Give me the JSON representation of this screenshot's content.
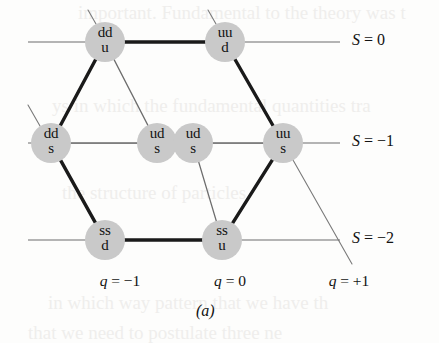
{
  "figure": {
    "caption": "(a)",
    "background_color": "#fdfdfc",
    "node_fill_color": "#c9c9c9",
    "thick_edge_color": "#1a1a1a",
    "thin_edge_color": "#6d6d6d"
  },
  "chart_data": {
    "type": "scatter",
    "xlabel": "q",
    "ylabel": "S",
    "grid": false,
    "legend": null,
    "x_tick_labels": [
      "q = -1",
      "q = 0",
      "q = +1"
    ],
    "x_tick_values": [
      -1,
      0,
      1
    ],
    "y_tick_labels": [
      "S = 0",
      "S = -1",
      "S = -2"
    ],
    "y_tick_values": [
      0,
      -1,
      -2
    ],
    "nodes": [
      {
        "id": "n1",
        "top": "dd",
        "bottom": "u",
        "q": -1,
        "S": 0,
        "cx": 105,
        "cy": 42
      },
      {
        "id": "n2",
        "top": "uu",
        "bottom": "d",
        "q": 0,
        "S": 0,
        "cx": 225,
        "cy": 42
      },
      {
        "id": "n3",
        "top": "dd",
        "bottom": "s",
        "q": -1,
        "S": -1,
        "cx": 51,
        "cy": 143
      },
      {
        "id": "n4",
        "top": "ud",
        "bottom": "s",
        "q": 0,
        "S": -1,
        "cx": 157,
        "cy": 143
      },
      {
        "id": "n5",
        "top": "ud",
        "bottom": "s",
        "q": 0,
        "S": -1,
        "cx": 193,
        "cy": 143
      },
      {
        "id": "n6",
        "top": "uu",
        "bottom": "s",
        "q": 1,
        "S": -1,
        "cx": 283,
        "cy": 143
      },
      {
        "id": "n7",
        "top": "ss",
        "bottom": "d",
        "q": -1,
        "S": -2,
        "cx": 105,
        "cy": 240
      },
      {
        "id": "n8",
        "top": "ss",
        "bottom": "u",
        "q": 0,
        "S": -2,
        "cx": 222,
        "cy": 240
      }
    ],
    "edges": [
      {
        "from": "n1",
        "to": "n2",
        "weight": "thick"
      },
      {
        "from": "n1",
        "to": "n3",
        "weight": "thick"
      },
      {
        "from": "n1",
        "to": "n4",
        "weight": "thin"
      },
      {
        "from": "n2",
        "to": "n6",
        "weight": "thick"
      },
      {
        "from": "n3",
        "to": "n4",
        "weight": "thin"
      },
      {
        "from": "n3",
        "to": "n7",
        "weight": "thick"
      },
      {
        "from": "n5",
        "to": "n6",
        "weight": "thin"
      },
      {
        "from": "n5",
        "to": "n8",
        "weight": "thin"
      },
      {
        "from": "n6",
        "to": "n8",
        "weight": "thick"
      },
      {
        "from": "n7",
        "to": "n8",
        "weight": "thick"
      }
    ]
  },
  "axes": {
    "strangeness_rows": [
      {
        "key": "s0",
        "label": "S = 0",
        "line_y": 42,
        "line_x1": 28,
        "line_x2": 340,
        "label_x": 352,
        "label_y": 31
      },
      {
        "key": "sm1",
        "label": "S = -1",
        "line_y": 143,
        "line_x1": 28,
        "line_x2": 340,
        "label_x": 352,
        "label_y": 132
      },
      {
        "key": "sm2",
        "label": "S = -2",
        "line_y": 240,
        "line_x1": 28,
        "line_x2": 340,
        "label_x": 352,
        "label_y": 229
      }
    ],
    "charge_columns": [
      {
        "key": "qm1",
        "label": "q = -1",
        "label_x": 120,
        "label_y": 272
      },
      {
        "key": "q0",
        "label": "q = 0",
        "label_x": 230,
        "label_y": 272
      },
      {
        "key": "qp1",
        "label": "q = +1",
        "label_x": 349,
        "label_y": 272
      }
    ]
  },
  "ghost_background_lines": [
    {
      "text": "important. Fundamental to the theory was t",
      "x": 78,
      "y": 2
    },
    {
      "text": "ys in which the fundamental quantities tra",
      "x": 52,
      "y": 95
    },
    {
      "text": "the structure of particles",
      "x": 62,
      "y": 182
    },
    {
      "text": "in which way pattern that we have th",
      "x": 48,
      "y": 292
    },
    {
      "text": "that we need to postulate three ne",
      "x": 28,
      "y": 322
    }
  ]
}
